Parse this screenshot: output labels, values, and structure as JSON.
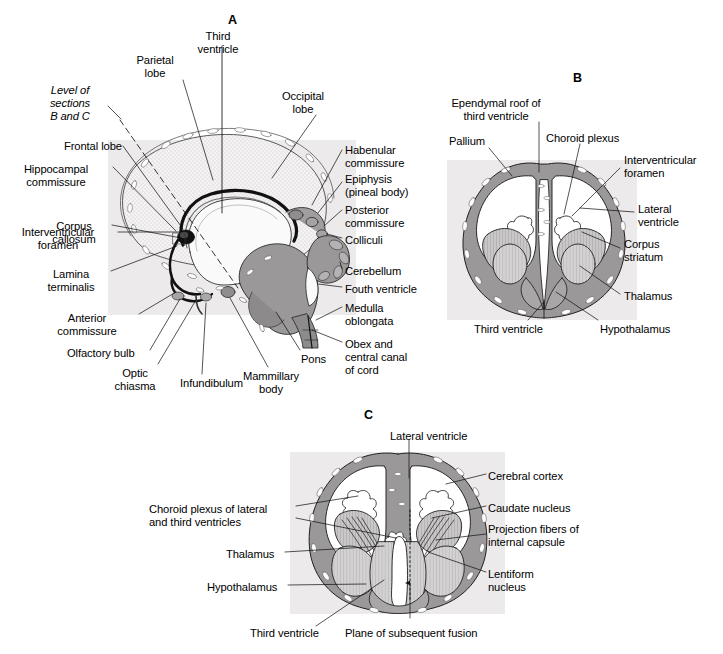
{
  "figure": {
    "background": "#ffffff",
    "tint_color": "#eceaea",
    "ink_color": "#1a1a1a",
    "gray_fill": "#9a9a9a",
    "light_gray_fill": "#c4c4c4",
    "panels": [
      {
        "letter": "A",
        "name": "panel-a",
        "description": "Midsagittal section of developing brain",
        "letter_pos": {
          "x": 228,
          "y": 14
        }
      },
      {
        "letter": "B",
        "name": "panel-b",
        "description": "Coronal section at level B",
        "letter_pos": {
          "x": 573,
          "y": 72
        }
      },
      {
        "letter": "C",
        "name": "panel-c",
        "description": "Coronal section at level C",
        "letter_pos": {
          "x": 364,
          "y": 409
        }
      }
    ],
    "labels_a": [
      {
        "id": "third-ventricle-a",
        "text": "Third\nventricle",
        "x": 218,
        "y": 30,
        "align": "center",
        "italic": false
      },
      {
        "id": "parietal-lobe",
        "text": "Parietal\nlobe",
        "x": 155,
        "y": 54,
        "align": "center",
        "italic": false
      },
      {
        "id": "occipital-lobe",
        "text": "Occipital\nlobe",
        "x": 303,
        "y": 90,
        "align": "center",
        "italic": false
      },
      {
        "id": "level-of-sections",
        "text": "Level of\nsections\nB and C",
        "x": 70,
        "y": 84,
        "align": "center",
        "italic": true
      },
      {
        "id": "frontal-lobe",
        "text": "Frontal lobe",
        "x": 64,
        "y": 140,
        "align": "left",
        "italic": false
      },
      {
        "id": "hippocampal-commissure",
        "text": "Hippocampal\ncommissure",
        "x": 56,
        "y": 163,
        "align": "center",
        "italic": false
      },
      {
        "id": "corpus-callosum",
        "text": "Corpus\ncallosum",
        "x": 74,
        "y": 220,
        "align": "center",
        "italic": false
      },
      {
        "id": "interventricular-foramen-a",
        "text": "Interventricular\nforamen",
        "x": 58,
        "y": 226,
        "align": "center",
        "italic": false
      },
      {
        "id": "lamina-terminalis",
        "text": "Lamina\nterminalis",
        "x": 71,
        "y": 268,
        "align": "center",
        "italic": false
      },
      {
        "id": "anterior-commissure",
        "text": "Anterior\ncommissure",
        "x": 87,
        "y": 312,
        "align": "center",
        "italic": false
      },
      {
        "id": "olfactory-bulb",
        "text": "Olfactory bulb",
        "x": 67,
        "y": 347,
        "align": "left",
        "italic": false
      },
      {
        "id": "optic-chiasma",
        "text": "Optic\nchiasma",
        "x": 135,
        "y": 367,
        "align": "center",
        "italic": false
      },
      {
        "id": "infundibulum",
        "text": "Infundibulum",
        "x": 180,
        "y": 377,
        "align": "left",
        "italic": false
      },
      {
        "id": "mammillary-body",
        "text": "Mammillary\nbody",
        "x": 271,
        "y": 370,
        "align": "center",
        "italic": false
      },
      {
        "id": "pons",
        "text": "Pons",
        "x": 301,
        "y": 353,
        "align": "left",
        "italic": false
      },
      {
        "id": "habenular-commissure",
        "text": "Habenular\ncommissure",
        "x": 345,
        "y": 144,
        "align": "left",
        "italic": false
      },
      {
        "id": "epiphysis",
        "text": "Epiphysis\n(pineal body)",
        "x": 345,
        "y": 173,
        "align": "left",
        "italic": false
      },
      {
        "id": "posterior-commissure",
        "text": "Posterior\ncommissure",
        "x": 345,
        "y": 204,
        "align": "left",
        "italic": false
      },
      {
        "id": "colliculi",
        "text": "Colliculi",
        "x": 345,
        "y": 234,
        "align": "left",
        "italic": false
      },
      {
        "id": "cerebellum",
        "text": "Cerebellum",
        "x": 345,
        "y": 265,
        "align": "left",
        "italic": false
      },
      {
        "id": "fourth-ventricle",
        "text": "Fouth ventricle",
        "x": 345,
        "y": 283,
        "align": "left",
        "italic": false
      },
      {
        "id": "medulla-oblongata",
        "text": "Medulla\noblongata",
        "x": 345,
        "y": 302,
        "align": "left",
        "italic": false
      },
      {
        "id": "obex-central-canal",
        "text": "Obex and\ncentral canal\nof cord",
        "x": 345,
        "y": 338,
        "align": "left",
        "italic": false
      }
    ],
    "labels_b": [
      {
        "id": "ependymal-roof",
        "text": "Ependymal roof of\nthird ventricle",
        "x": 496,
        "y": 97,
        "align": "center",
        "italic": false
      },
      {
        "id": "pallium",
        "text": "Pallium",
        "x": 467,
        "y": 135,
        "align": "center",
        "italic": false
      },
      {
        "id": "choroid-plexus-b",
        "text": "Choroid plexus",
        "x": 546,
        "y": 132,
        "align": "left",
        "italic": false
      },
      {
        "id": "interventricular-foramen-b",
        "text": "Interventricular\nforamen",
        "x": 624,
        "y": 154,
        "align": "left",
        "italic": false
      },
      {
        "id": "lateral-ventricle-b",
        "text": "Lateral\nventricle",
        "x": 638,
        "y": 203,
        "align": "left",
        "italic": false
      },
      {
        "id": "corpus-striatum",
        "text": "Corpus\nstriatum",
        "x": 624,
        "y": 238,
        "align": "left",
        "italic": false
      },
      {
        "id": "thalamus-b",
        "text": "Thalamus",
        "x": 624,
        "y": 290,
        "align": "left",
        "italic": false
      },
      {
        "id": "hypothalamus-b",
        "text": "Hypothalamus",
        "x": 600,
        "y": 323,
        "align": "left",
        "italic": false
      },
      {
        "id": "third-ventricle-b",
        "text": "Third ventricle",
        "x": 474,
        "y": 323,
        "align": "left",
        "italic": false
      }
    ],
    "labels_c": [
      {
        "id": "lateral-ventricle-c",
        "text": "Lateral ventricle",
        "x": 390,
        "y": 430,
        "align": "left",
        "italic": false
      },
      {
        "id": "choroid-plexus-c",
        "text": "Choroid plexus of lateral\nand third ventricles",
        "x": 149,
        "y": 503,
        "align": "left",
        "italic": false
      },
      {
        "id": "thalamus-c",
        "text": "Thalamus",
        "x": 226,
        "y": 548,
        "align": "left",
        "italic": false
      },
      {
        "id": "hypothalamus-c",
        "text": "Hypothalamus",
        "x": 207,
        "y": 581,
        "align": "left",
        "italic": false
      },
      {
        "id": "third-ventricle-c",
        "text": "Third ventricle",
        "x": 250,
        "y": 627,
        "align": "left",
        "italic": false
      },
      {
        "id": "plane-of-fusion",
        "text": "Plane of subsequent fusion",
        "x": 345,
        "y": 627,
        "align": "left",
        "italic": false
      },
      {
        "id": "cerebral-cortex",
        "text": "Cerebral cortex",
        "x": 488,
        "y": 470,
        "align": "left",
        "italic": false
      },
      {
        "id": "caudate-nucleus",
        "text": "Caudate nucleus",
        "x": 488,
        "y": 502,
        "align": "left",
        "italic": false
      },
      {
        "id": "projection-fibers",
        "text": "Projection fibers of\ninternal capsule",
        "x": 488,
        "y": 523,
        "align": "left",
        "italic": false
      },
      {
        "id": "lentiform-nucleus",
        "text": "Lentiform\nnucleus",
        "x": 488,
        "y": 568,
        "align": "left",
        "italic": false
      }
    ]
  }
}
